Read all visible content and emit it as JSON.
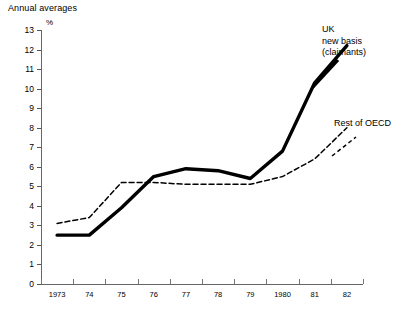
{
  "chart_data": {
    "type": "line",
    "title": "Annual averages",
    "xlabel": "",
    "ylabel": "%",
    "ylim": [
      0,
      13
    ],
    "xlim": [
      1973,
      1982
    ],
    "grid": false,
    "legend_position": "inline-annotations",
    "categories": [
      "1973",
      "74",
      "75",
      "76",
      "77",
      "78",
      "79",
      "1980",
      "81",
      "82"
    ],
    "y_ticks": [
      "13",
      "12",
      "11",
      "10",
      "9",
      "8",
      "7",
      "6",
      "5",
      "4",
      "3",
      "2",
      "1",
      "0"
    ],
    "series": [
      {
        "name": "UK new basis (claimants)",
        "label_text": "UK\nnew basis\n(claimants)",
        "style": "solid",
        "color": "#000000",
        "width": 3.4,
        "values": [
          2.5,
          2.5,
          3.9,
          5.5,
          5.9,
          5.8,
          5.4,
          6.8,
          10.3,
          12.2
        ]
      },
      {
        "name": "Rest of OECD",
        "label_text": "Rest of OECD",
        "style": "dashed",
        "color": "#000000",
        "width": 1.5,
        "values": [
          3.1,
          3.4,
          5.2,
          5.2,
          5.1,
          5.1,
          5.1,
          5.5,
          6.4,
          8.0
        ]
      }
    ]
  }
}
